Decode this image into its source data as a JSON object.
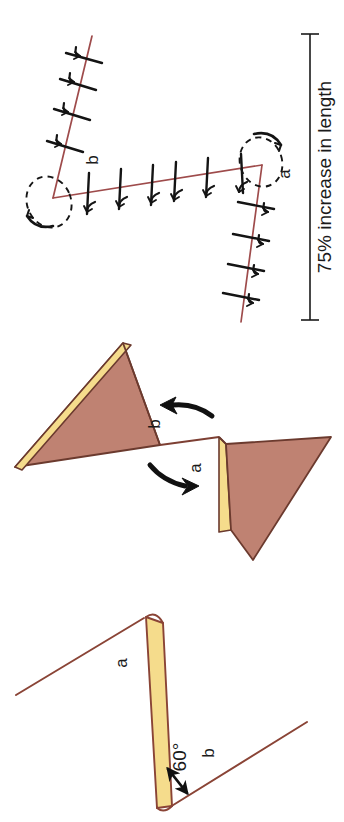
{
  "figure": {
    "kind": "structural-geology-deformation-diagram",
    "orientation_note": "all text rendered rotated 90 degrees counter-clockwise",
    "background_color": "#ffffff",
    "colors": {
      "bed_line": "#9e4b4b",
      "outline": "#6b3a2e",
      "layer_fill_brown": "#bf8272",
      "layer_fill_yellow": "#f5dc8c",
      "ink": "#1a1a1a"
    }
  },
  "panels": [
    {
      "id": "panel-initial",
      "name": "initial-geometry-panel",
      "labels": [
        {
          "id": "label-a",
          "text": "a"
        },
        {
          "id": "label-b",
          "text": "b"
        },
        {
          "id": "label-angle",
          "text": "60°"
        }
      ]
    },
    {
      "id": "panel-rotation",
      "name": "rotation-panel",
      "labels": [
        {
          "id": "label-a",
          "text": "a"
        },
        {
          "id": "label-b",
          "text": "b"
        }
      ],
      "arrows": [
        {
          "id": "arrow-ccw",
          "name": "rotation-arrow-upper",
          "direction": "counter-clockwise"
        },
        {
          "id": "arrow-cw",
          "name": "rotation-arrow-lower",
          "direction": "clockwise"
        }
      ]
    },
    {
      "id": "panel-extension",
      "name": "extension-panel",
      "labels": [
        {
          "id": "label-a",
          "text": "a"
        },
        {
          "id": "label-b",
          "text": "b"
        }
      ],
      "measure": {
        "id": "measure-bar",
        "text": "75% increase in length"
      },
      "limbs": [
        {
          "id": "limb-b",
          "name": "limb-b",
          "tick_count": 6
        },
        {
          "id": "limb-a-upper",
          "name": "limb-a-upper",
          "tick_count": 4
        },
        {
          "id": "limb-a-lower",
          "name": "limb-a-lower",
          "tick_count": 4
        }
      ],
      "hinges": [
        {
          "id": "hinge-left",
          "name": "hinge-marker-left"
        },
        {
          "id": "hinge-right",
          "name": "hinge-marker-right"
        }
      ]
    }
  ],
  "text": {
    "a": "a",
    "b": "b",
    "angle": "60°",
    "measure": "75% increase in length"
  }
}
